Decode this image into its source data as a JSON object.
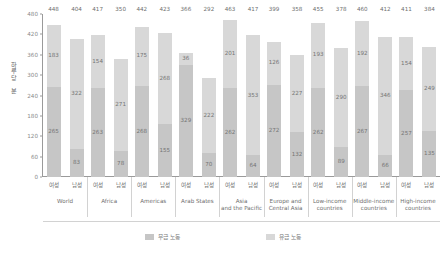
{
  "chart_data": {
    "type": "bar",
    "subtype": "stacked-grouped",
    "title": "",
    "xlabel": "",
    "ylabel": "하루당 분",
    "ylim": [
      0,
      480
    ],
    "yticks": [
      0,
      60,
      120,
      180,
      240,
      300,
      360,
      420,
      480
    ],
    "grid": false,
    "legend_position": "bottom",
    "series": [
      {
        "name": "무급 노동",
        "color": "#c6c6c6"
      },
      {
        "name": "유급 노동",
        "color": "#d8d8d8"
      }
    ],
    "categories": [
      "World",
      "Africa",
      "Americas",
      "Arab States",
      "Asia\nand the Pacific",
      "Europe and\nCentral Asia",
      "Low-income\ncountries",
      "Middle-income\ncountries",
      "High-income\ncountries"
    ],
    "subcategories": [
      "여성",
      "남성"
    ],
    "bars": [
      {
        "group": "World",
        "sex": "여성",
        "unpaid": 265,
        "paid": 183,
        "total": 448
      },
      {
        "group": "World",
        "sex": "남성",
        "unpaid": 83,
        "paid": 322,
        "total": 404
      },
      {
        "group": "Africa",
        "sex": "여성",
        "unpaid": 263,
        "paid": 154,
        "total": 417
      },
      {
        "group": "Africa",
        "sex": "남성",
        "unpaid": 78,
        "paid": 271,
        "total": 350
      },
      {
        "group": "Americas",
        "sex": "여성",
        "unpaid": 268,
        "paid": 175,
        "total": 442
      },
      {
        "group": "Americas",
        "sex": "남성",
        "unpaid": 155,
        "paid": 268,
        "total": 423
      },
      {
        "group": "Arab States",
        "sex": "여성",
        "unpaid": 329,
        "paid": 36,
        "total": 366
      },
      {
        "group": "Arab States",
        "sex": "남성",
        "unpaid": 70,
        "paid": 222,
        "total": 292
      },
      {
        "group": "Asia and the Pacific",
        "sex": "여성",
        "unpaid": 262,
        "paid": 201,
        "total": 463
      },
      {
        "group": "Asia and the Pacific",
        "sex": "남성",
        "unpaid": 64,
        "paid": 353,
        "total": 417
      },
      {
        "group": "Europe and Central Asia",
        "sex": "여성",
        "unpaid": 272,
        "paid": 126,
        "total": 399
      },
      {
        "group": "Europe and Central Asia",
        "sex": "남성",
        "unpaid": 132,
        "paid": 227,
        "total": 358
      },
      {
        "group": "Low-income countries",
        "sex": "여성",
        "unpaid": 262,
        "paid": 193,
        "total": 455
      },
      {
        "group": "Low-income countries",
        "sex": "남성",
        "unpaid": 89,
        "paid": 290,
        "total": 378
      },
      {
        "group": "Middle-income countries",
        "sex": "여성",
        "unpaid": 267,
        "paid": 192,
        "total": 460
      },
      {
        "group": "Middle-income countries",
        "sex": "남성",
        "unpaid": 66,
        "paid": 346,
        "total": 412
      },
      {
        "group": "High-income countries",
        "sex": "여성",
        "unpaid": 257,
        "paid": 154,
        "total": 411
      },
      {
        "group": "High-income countries",
        "sex": "남성",
        "unpaid": 135,
        "paid": 249,
        "total": 384
      }
    ]
  }
}
